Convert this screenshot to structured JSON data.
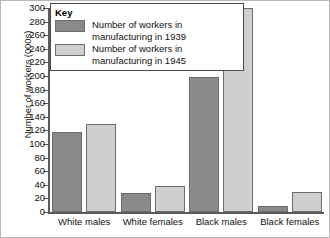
{
  "chart_data": {
    "type": "bar",
    "title": "",
    "xlabel": "",
    "ylabel": "Number of workers (000s)",
    "ylim": [
      0,
      300
    ],
    "ytick_step": 20,
    "grid": false,
    "legend_position": "top-left",
    "categories": [
      "White males",
      "White females",
      "Black males",
      "Black females"
    ],
    "ytick_labels": [
      "0",
      "20",
      "40",
      "60",
      "80",
      "100",
      "120",
      "140",
      "160",
      "180",
      "200",
      "220",
      "240",
      "260",
      "280",
      "300"
    ],
    "series": [
      {
        "name": "Number of workers in manufacturing in 1939",
        "color": "#8a8a8a",
        "values": [
          117,
          28,
          198,
          9
        ]
      },
      {
        "name": "Number of workers in manufacturing in 1945",
        "color": "#cfcfcf",
        "values": [
          130,
          38,
          300,
          29
        ]
      }
    ]
  },
  "legend": {
    "title": "Key",
    "entries": [
      {
        "label": "Number of workers in\nmanufacturing in 1939",
        "swatch": "#8a8a8a"
      },
      {
        "label": "Number of workers in\nmanufacturing in 1945",
        "swatch": "#cfcfcf"
      }
    ]
  },
  "axis": {
    "y_title": "Number of workers (000s)"
  }
}
